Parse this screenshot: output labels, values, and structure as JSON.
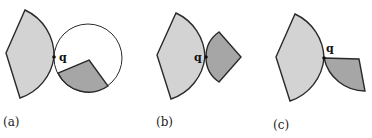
{
  "figure": {
    "panels": [
      {
        "id": "a",
        "label": "(a)",
        "point_label": "q"
      },
      {
        "id": "b",
        "label": "(b)",
        "point_label": "q"
      },
      {
        "id": "c",
        "label": "(c)",
        "point_label": "q"
      }
    ],
    "colors": {
      "light_fill": "#d3d3d3",
      "dark_fill": "#a6a6a6",
      "stroke": "#2a2a2a",
      "circle_fill": "#ffffff"
    }
  }
}
